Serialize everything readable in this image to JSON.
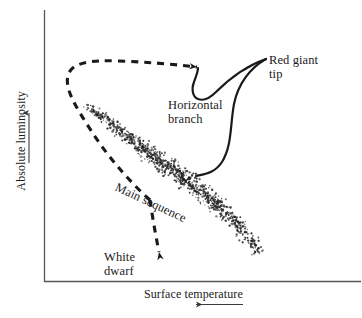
{
  "figure": {
    "kind": "hertzsprung-russell-diagram",
    "background_color": "#ffffff",
    "ink_color": "#1a1a1a",
    "axis_color": "#55555a"
  },
  "axes": {
    "y_label": "Absolute luminosity",
    "y_arrow_direction": "up",
    "x_label": "Surface temperature",
    "x_arrow_direction": "left"
  },
  "annotations": {
    "red_giant_tip": "Red giant\ntip",
    "horizontal_branch": "Horizontal\nbranch",
    "main_sequence": "Main sequence",
    "white_dwarf": "White\ndwarf"
  },
  "chart_data": {
    "type": "scatter",
    "title": "",
    "xlabel": "Surface temperature",
    "ylabel": "Absolute luminosity",
    "xlim": [
      0,
      1
    ],
    "ylim": [
      0,
      1
    ],
    "x_axis_increases": "leftward",
    "y_axis_increases": "upward",
    "grid": false,
    "legend": null,
    "series": [
      {
        "name": "Main sequence",
        "kind": "star-scatter-band",
        "point_count": 900,
        "marker": "dot",
        "marker_size_px": 1.1,
        "path": [
          [
            85,
            104
          ],
          [
            110,
            122
          ],
          [
            140,
            146
          ],
          [
            170,
            168
          ],
          [
            200,
            190
          ],
          [
            228,
            214
          ],
          [
            248,
            236
          ],
          [
            259,
            254
          ]
        ],
        "band_half_width_px": [
          3.0,
          5.0,
          7.0,
          8.0,
          8.5,
          8.0,
          6.5,
          5.0
        ],
        "density_profile": [
          0.25,
          0.55,
          0.9,
          1.0,
          1.0,
          0.85,
          0.55,
          0.3
        ]
      }
    ],
    "tracks": [
      {
        "name": "Evolutionary track",
        "style": "dashed",
        "stroke_width_px": 3,
        "dash_pattern": "7 6",
        "path": [
          [
            150,
            200
          ],
          [
            120,
            168
          ],
          [
            96,
            136
          ],
          [
            78,
            108
          ],
          [
            68,
            86
          ],
          [
            67,
            72
          ],
          [
            74,
            64
          ],
          [
            90,
            62
          ],
          [
            120,
            63
          ],
          [
            160,
            65
          ],
          [
            196,
            67
          ]
        ],
        "arrow_head_at": [
          198,
          67
        ],
        "arrow_head_direction": "left"
      },
      {
        "name": "White dwarf track",
        "style": "dashed",
        "stroke_width_px": 3,
        "dash_pattern": "7 6",
        "path": [
          [
            150,
            200
          ],
          [
            152,
            222
          ],
          [
            156,
            242
          ],
          [
            160,
            254
          ]
        ],
        "arrow_head_at": [
          160,
          256
        ],
        "arrow_head_direction": "down-right"
      }
    ],
    "leaders": [
      {
        "name": "red-giant-tip-to-horizontal-branch",
        "style": "solid",
        "from": [
          266,
          60
        ],
        "to": [
          196,
          68
        ]
      },
      {
        "name": "red-giant-tip-to-main-sequence",
        "style": "solid",
        "from": [
          266,
          60
        ],
        "to": [
          196,
          176
        ]
      }
    ]
  }
}
